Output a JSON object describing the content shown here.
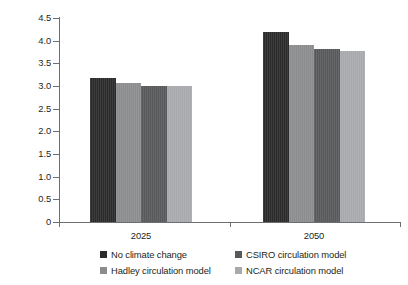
{
  "chart_data": {
    "type": "bar",
    "title": "",
    "subtitle": "",
    "xlabel": "",
    "ylabel": "Metric tons per ha",
    "categories": [
      "2025",
      "2050"
    ],
    "series": [
      {
        "name": "No climate change",
        "color": "#2b2b2b",
        "values": [
          3.17,
          4.2
        ]
      },
      {
        "name": "Hadley circulation model",
        "color": "#8b8c8e",
        "values": [
          3.06,
          3.9
        ]
      },
      {
        "name": "CSIRO circulation model",
        "color": "#58595b",
        "values": [
          3.0,
          3.82
        ]
      },
      {
        "name": "NCAR circulation model",
        "color": "#a7a9ac",
        "values": [
          3.01,
          3.77
        ]
      }
    ],
    "ylim": [
      0,
      4.5
    ],
    "ytick_values": [
      0,
      0.5,
      1.0,
      1.5,
      2.0,
      2.5,
      3.0,
      3.5,
      4.0,
      4.5
    ],
    "ytick_labels": [
      "0",
      "0.5",
      "1.0",
      "1.5",
      "2.0",
      "2.5",
      "3.0",
      "3.5",
      "4.0",
      "4.5"
    ],
    "grid": false,
    "legend_position": "bottom",
    "annotations": []
  },
  "axis": {
    "y_title": "Metric tons per ha"
  },
  "legend": {
    "items": [
      {
        "label": "No climate change",
        "color": "#2b2b2b"
      },
      {
        "label": "CSIRO circulation model",
        "color": "#58595b"
      },
      {
        "label": "Hadley circulation model",
        "color": "#8b8c8e"
      },
      {
        "label": "NCAR circulation model",
        "color": "#a7a9ac"
      }
    ]
  }
}
